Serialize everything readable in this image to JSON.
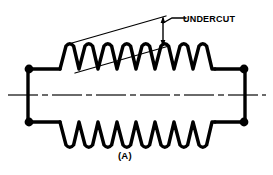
{
  "figure": {
    "caption": "(A)",
    "colors": {
      "ink": "#000000",
      "background": "#ffffff",
      "centerline": "#3a3a3a"
    }
  },
  "annotations": {
    "undercut_label": "UNDERCUT"
  },
  "geometry": {
    "part": {
      "left_flange_x": 28,
      "right_flange_x": 245,
      "top_body_y": 69,
      "bottom_body_y": 122,
      "top_shoulder_y": 69,
      "bottom_shoulder_y": 122,
      "corner_dot_radius": 4.2,
      "outline_width": 3.2
    },
    "threads": {
      "count": 6,
      "start_x": 60,
      "end_x": 215,
      "top_peak_y": 44,
      "top_valley_y": 69,
      "bottom_valley_y": 147,
      "bottom_peak_y": 122
    },
    "centerline": {
      "y": 95,
      "x_start": 8,
      "x_end": 266,
      "dash_pattern": "28 4 6 4"
    },
    "undercut_leader": {
      "upper_line": {
        "x1": 72,
        "y1": 43,
        "x2": 165,
        "y2": 16
      },
      "lower_line": {
        "x1": 75,
        "y1": 73,
        "x2": 168,
        "y2": 46
      },
      "dimension_arrow": {
        "x": 163,
        "y_top": 18,
        "y_bottom": 45
      },
      "label_leader": {
        "x1": 163,
        "y1": 22,
        "x2": 172,
        "y2": 18,
        "x3": 184,
        "y3": 18
      }
    }
  }
}
